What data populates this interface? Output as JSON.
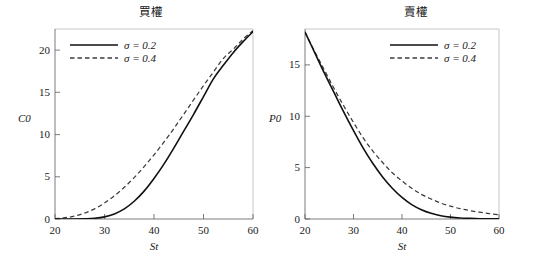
{
  "figure": {
    "width": 534,
    "height": 270,
    "background": "#ffffff",
    "curve_color_solid": "#111111",
    "curve_color_dashed": "#3c3c3c",
    "frame_color": "#b8b8b8",
    "axis_color": "#5a5a5a"
  },
  "panels": [
    {
      "id": "call",
      "title": "買權",
      "ylabel": "C0",
      "xlabel": "St"
    },
    {
      "id": "put",
      "title": "賣權",
      "ylabel": "P0",
      "xlabel": "St"
    }
  ],
  "legend": {
    "entries": [
      {
        "label": "σ = 0.2",
        "sigma": "σ",
        "equals_value": "= 0.2",
        "style": "solid"
      },
      {
        "label": "σ = 0.4",
        "sigma": "σ",
        "equals_value": "= 0.4",
        "style": "dashed"
      }
    ]
  },
  "chart_data": [
    {
      "type": "line",
      "id": "call-option-chart",
      "title": "買權",
      "xlabel": "St",
      "ylabel": "C0",
      "xlim": [
        20,
        60
      ],
      "ylim": [
        0,
        22.5
      ],
      "xticks": [
        20,
        30,
        40,
        50,
        60
      ],
      "yticks": [
        0,
        5,
        10,
        15,
        20
      ],
      "xtick_labels": [
        "20",
        "30",
        "40",
        "50",
        "60"
      ],
      "ytick_labels": [
        "0",
        "5",
        "10",
        "15",
        "20"
      ],
      "grid": false,
      "legend_position": "top-left",
      "x": [
        20,
        22,
        24,
        26,
        28,
        30,
        32,
        34,
        36,
        38,
        40,
        42,
        44,
        46,
        48,
        50,
        52,
        54,
        56,
        58,
        60
      ],
      "series": [
        {
          "name": "σ = 0.2",
          "style": "solid",
          "values": [
            0.0,
            0.0,
            0.0,
            0.02,
            0.08,
            0.25,
            0.6,
            1.2,
            2.1,
            3.3,
            4.8,
            6.5,
            8.4,
            10.4,
            12.4,
            14.5,
            16.6,
            18.2,
            19.7,
            21.0,
            22.2
          ]
        },
        {
          "name": "σ = 0.4",
          "style": "dashed",
          "values": [
            0.05,
            0.15,
            0.35,
            0.7,
            1.2,
            1.9,
            2.75,
            3.75,
            4.9,
            6.2,
            7.6,
            9.1,
            10.7,
            12.4,
            14.1,
            15.8,
            17.4,
            19.0,
            20.1,
            21.3,
            22.3
          ]
        }
      ]
    },
    {
      "type": "line",
      "id": "put-option-chart",
      "title": "賣權",
      "xlabel": "St",
      "ylabel": "P0",
      "xlim": [
        20,
        60
      ],
      "ylim": [
        0,
        18.5
      ],
      "xticks": [
        20,
        30,
        40,
        50,
        60
      ],
      "yticks": [
        0,
        5,
        10,
        15
      ],
      "xtick_labels": [
        "20",
        "30",
        "40",
        "50",
        "60"
      ],
      "ytick_labels": [
        "0",
        "5",
        "10",
        "15"
      ],
      "grid": false,
      "legend_position": "top-right",
      "x": [
        20,
        22,
        24,
        26,
        28,
        30,
        32,
        34,
        36,
        38,
        40,
        42,
        44,
        46,
        48,
        50,
        52,
        54,
        56,
        58,
        60
      ],
      "series": [
        {
          "name": "σ = 0.2",
          "style": "solid",
          "values": [
            18.2,
            16.2,
            14.2,
            12.3,
            10.4,
            8.6,
            6.9,
            5.4,
            4.1,
            3.0,
            2.1,
            1.4,
            0.9,
            0.55,
            0.32,
            0.18,
            0.1,
            0.06,
            0.03,
            0.02,
            0.01
          ]
        },
        {
          "name": "σ = 0.4",
          "style": "dashed",
          "values": [
            18.2,
            16.3,
            14.5,
            12.7,
            11.0,
            9.4,
            7.9,
            6.6,
            5.5,
            4.5,
            3.7,
            3.0,
            2.4,
            1.95,
            1.55,
            1.25,
            1.0,
            0.82,
            0.66,
            0.53,
            0.42
          ]
        }
      ]
    }
  ]
}
